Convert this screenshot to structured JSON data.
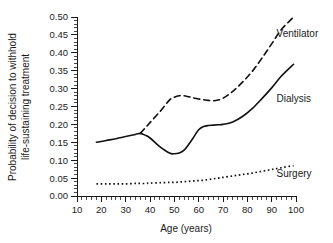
{
  "figure": {
    "background_color": "#ffffff",
    "line_color": "#111111"
  },
  "chart_data": {
    "type": "line",
    "title": "",
    "subtitle": "",
    "xlabel": "Age (years)",
    "ylabel": "Probability of decision to withhold life-sustaining treatment",
    "ylabel_line1": "Probability of decision to withhold",
    "ylabel_line2": "life-sustaining treatment",
    "xlim": [
      10,
      100
    ],
    "ylim": [
      0.0,
      0.5
    ],
    "grid": false,
    "legend_position": "inline-right-of-curve",
    "xticks": [
      10,
      20,
      30,
      40,
      50,
      60,
      70,
      80,
      90,
      100
    ],
    "xtick_labels": [
      "10",
      "20",
      "30",
      "40",
      "50",
      "60",
      "70",
      "80",
      "90",
      "100"
    ],
    "x_minor_tick_interval": 2,
    "yticks": [
      0.0,
      0.05,
      0.1,
      0.15,
      0.2,
      0.25,
      0.3,
      0.35,
      0.4,
      0.45,
      0.5
    ],
    "ytick_labels": [
      "0.00",
      "0.05",
      "0.10",
      "0.15",
      "0.20",
      "0.25",
      "0.30",
      "0.35",
      "0.40",
      "0.45",
      "0.50"
    ],
    "y_minor_tick_interval": 0.01,
    "x": [
      18,
      22,
      26,
      30,
      34,
      36,
      38,
      40,
      44,
      48,
      50,
      52,
      54,
      56,
      58,
      60,
      62,
      64,
      66,
      68,
      70,
      74,
      78,
      82,
      86,
      90,
      94,
      99
    ],
    "series": [
      {
        "name": "Ventilator",
        "label": "Ventilator",
        "style": "dashed",
        "x_start": 36,
        "values": [
          null,
          null,
          null,
          null,
          null,
          0.175,
          0.19,
          0.205,
          0.235,
          0.268,
          0.276,
          0.28,
          0.28,
          0.277,
          0.274,
          0.271,
          0.269,
          0.267,
          0.266,
          0.268,
          0.273,
          0.292,
          0.318,
          0.348,
          0.385,
          0.425,
          0.465,
          0.5
        ],
        "label_position": {
          "x": 92,
          "y": 0.455
        }
      },
      {
        "name": "Dialysis",
        "label": "Dialysis",
        "style": "solid",
        "x_start": 18,
        "values": [
          0.15,
          0.155,
          0.16,
          0.166,
          0.172,
          0.175,
          0.17,
          0.162,
          0.138,
          0.12,
          0.118,
          0.12,
          0.128,
          0.145,
          0.165,
          0.185,
          0.194,
          0.197,
          0.198,
          0.199,
          0.2,
          0.207,
          0.222,
          0.244,
          0.272,
          0.302,
          0.335,
          0.368
        ],
        "label_position": {
          "x": 92,
          "y": 0.272
        }
      },
      {
        "name": "Surgery",
        "label": "Surgery",
        "style": "dotted",
        "x_start": 18,
        "values": [
          0.034,
          0.034,
          0.034,
          0.034,
          0.035,
          0.035,
          0.035,
          0.036,
          0.037,
          0.038,
          0.038,
          0.039,
          0.04,
          0.041,
          0.042,
          0.043,
          0.044,
          0.046,
          0.048,
          0.05,
          0.052,
          0.056,
          0.06,
          0.064,
          0.069,
          0.074,
          0.079,
          0.085
        ],
        "label_position": {
          "x": 92,
          "y": 0.063
        }
      }
    ]
  }
}
